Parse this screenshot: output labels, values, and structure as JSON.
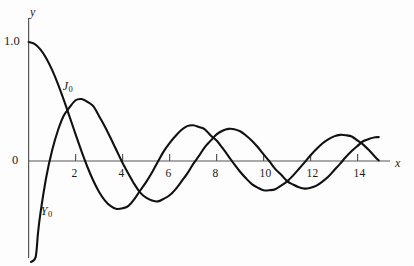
{
  "chart_data": {
    "type": "line",
    "title": "",
    "subtitle": "",
    "xlabel": "x",
    "ylabel": "y",
    "xlim": [
      -0.2,
      15.4
    ],
    "ylim": [
      -1.05,
      1.18
    ],
    "grid": false,
    "legend_position": "inline-annotations",
    "xticks": [
      2,
      4,
      6,
      8,
      10,
      12,
      14
    ],
    "xtick_labels": [
      "2",
      "4",
      "6",
      "8",
      "10",
      "12",
      "14"
    ],
    "yticks": [
      0,
      1.0
    ],
    "ytick_labels": [
      "0",
      "1.0"
    ],
    "annotations": [
      {
        "text": "J",
        "sub": "0",
        "x": 1.45,
        "y": 0.68
      },
      {
        "text": "Y",
        "sub": "0",
        "x": 0.52,
        "y": -0.37
      }
    ],
    "series": [
      {
        "name": "J0",
        "label": "J",
        "label_sub": "0",
        "color": "#111111",
        "x": [
          0,
          0.25,
          0.5,
          0.75,
          1,
          1.25,
          1.5,
          1.75,
          2,
          2.25,
          2.5,
          2.75,
          3,
          3.25,
          3.5,
          3.75,
          4,
          4.25,
          4.5,
          4.75,
          5,
          5.25,
          5.5,
          5.75,
          6,
          6.25,
          6.5,
          6.75,
          7,
          7.25,
          7.5,
          7.75,
          8,
          8.25,
          8.5,
          8.75,
          9,
          9.25,
          9.5,
          9.75,
          10,
          10.25,
          10.5,
          10.75,
          11,
          11.25,
          11.5,
          11.75,
          12,
          12.25,
          12.5,
          12.75,
          13,
          13.25,
          13.5,
          13.75,
          14,
          14.25,
          14.5,
          14.75,
          14.9
        ],
        "y": [
          1,
          0.9844,
          0.9385,
          0.8642,
          0.7652,
          0.6459,
          0.5118,
          0.369,
          0.2239,
          0.0827,
          -0.0484,
          -0.1641,
          -0.2601,
          -0.3325,
          -0.3801,
          -0.4026,
          -0.3971,
          -0.3766,
          -0.3205,
          -0.2477,
          -0.1776,
          -0.0968,
          -0.0068,
          0.0813,
          0.1506,
          0.2095,
          0.2601,
          0.2929,
          0.3001,
          0.285,
          0.2663,
          0.2139,
          0.1717,
          0.1093,
          0.0419,
          -0.0272,
          -0.0903,
          -0.1454,
          -0.1939,
          -0.2243,
          -0.2459,
          -0.2454,
          -0.2366,
          -0.2065,
          -0.1712,
          -0.1228,
          -0.0677,
          -0.0097,
          0.0477,
          0.1002,
          0.1469,
          0.1816,
          0.2069,
          0.2197,
          0.2167,
          0.2058,
          0.1711,
          0.1359,
          0.0875,
          0.0337,
          0.0046
        ]
      },
      {
        "name": "Y0",
        "label": "Y",
        "label_sub": "0",
        "color": "#111111",
        "x": [
          0.1,
          0.2,
          0.3,
          0.4,
          0.5,
          0.75,
          1,
          1.25,
          1.5,
          1.75,
          2,
          2.25,
          2.5,
          2.75,
          3,
          3.25,
          3.5,
          3.75,
          4,
          4.25,
          4.5,
          4.75,
          5,
          5.25,
          5.5,
          5.75,
          6,
          6.25,
          6.5,
          6.75,
          7,
          7.25,
          7.5,
          7.75,
          8,
          8.25,
          8.5,
          8.75,
          9,
          9.25,
          9.5,
          9.75,
          10,
          10.25,
          10.5,
          10.75,
          11,
          11.25,
          11.5,
          11.75,
          12,
          12.25,
          12.5,
          12.75,
          13,
          13.25,
          13.5,
          13.75,
          14,
          14.25,
          14.5,
          14.75,
          14.9
        ],
        "y": [
          -1.534,
          -1.081,
          -0.807,
          -0.606,
          -0.445,
          -0.137,
          0.088,
          0.2582,
          0.3824,
          0.452,
          0.5104,
          0.5208,
          0.4981,
          0.4605,
          0.3769,
          0.2882,
          0.189,
          0.086,
          -0.0169,
          -0.108,
          -0.1947,
          -0.2655,
          -0.3085,
          -0.3312,
          -0.3395,
          -0.3177,
          -0.2882,
          -0.2379,
          -0.1732,
          -0.1065,
          -0.0259,
          0.043,
          0.1173,
          0.1714,
          0.2235,
          0.2538,
          0.27,
          0.2674,
          0.2499,
          0.2146,
          0.1712,
          0.1172,
          0.0557,
          -0.0038,
          -0.0684,
          -0.1158,
          -0.1688,
          -0.1979,
          -0.2206,
          -0.2324,
          -0.2252,
          -0.2072,
          -0.1732,
          -0.1325,
          -0.0782,
          -0.024,
          0.033,
          0.0835,
          0.1272,
          0.168,
          0.1867,
          0.1993,
          0.201
        ]
      }
    ]
  },
  "axes": {
    "y_axis_label": "y",
    "x_axis_label": "x",
    "y_top_value": "1.0",
    "origin_value": "0"
  }
}
